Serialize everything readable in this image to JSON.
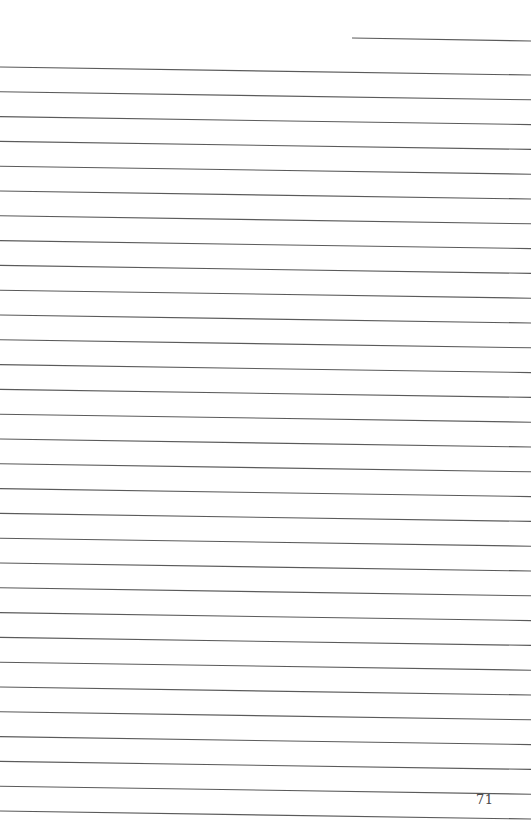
{
  "page": {
    "type": "lined-notebook-page",
    "page_number": "71",
    "line_color": "#5a5a5a",
    "background": "#ffffff",
    "header_line": {
      "x1": 352,
      "y1": 38,
      "x2": 531,
      "y2": 41
    },
    "ruled_lines": {
      "count": 31,
      "left_start_y": 67,
      "right_start_y": 75,
      "spacing": 24.8,
      "x_start": 0,
      "x_end": 531
    }
  }
}
